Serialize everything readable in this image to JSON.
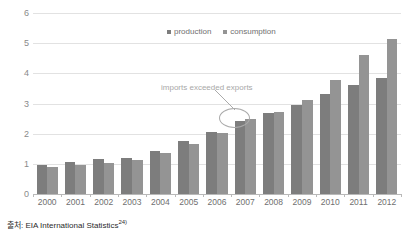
{
  "chart_data": {
    "type": "bar",
    "title": "",
    "subtitle": "",
    "xlabel": "",
    "ylabel": "",
    "ylim": [
      0,
      6
    ],
    "yticks": [
      0,
      1,
      2,
      3,
      4,
      5,
      6
    ],
    "ytick_labels": [
      "0",
      "1",
      "2",
      "3",
      "4",
      "5",
      "6"
    ],
    "grid": true,
    "legend_position": "top-center",
    "categories": [
      "2000",
      "2001",
      "2002",
      "2003",
      "2004",
      "2005",
      "2006",
      "2007",
      "2008",
      "2009",
      "2010",
      "2011",
      "2012"
    ],
    "series": [
      {
        "name": "production",
        "color": "#7d7d7d",
        "values": [
          0.96,
          1.06,
          1.15,
          1.18,
          1.44,
          1.75,
          2.06,
          2.43,
          2.67,
          2.95,
          3.33,
          3.62,
          3.83
        ]
      },
      {
        "name": "consumption",
        "color": "#949494",
        "values": [
          0.9,
          0.96,
          1.04,
          1.12,
          1.35,
          1.65,
          2.02,
          2.48,
          2.72,
          3.12,
          3.78,
          4.62,
          5.15
        ]
      }
    ],
    "annotations": [
      {
        "text": "imports exceeded exports",
        "target_category": "2007",
        "color": "#a8a8a8"
      }
    ]
  },
  "legend": {
    "items": [
      {
        "label": "production"
      },
      {
        "label": "consumption"
      }
    ]
  },
  "annotation": {
    "label": "imports exceeded exports"
  },
  "source": {
    "prefix": "출처",
    "text": "출처: EIA International Statistics",
    "note": "24)"
  }
}
